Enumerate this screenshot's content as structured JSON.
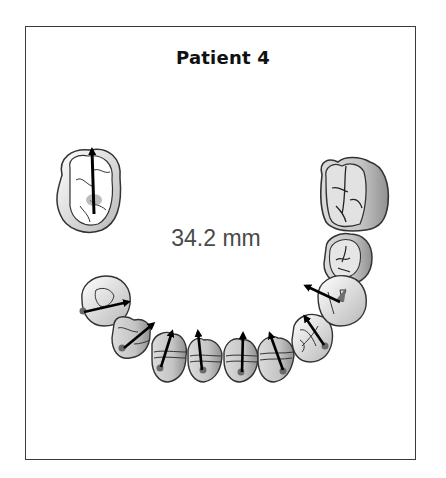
{
  "figure": {
    "title": "Patient 4",
    "measurement": "34.2 mm",
    "colors": {
      "outline": "#333333",
      "shade": "#bdbdbd",
      "arrow": "#000000",
      "dot": "#6a6a6a",
      "measurement_text": "#4a4a4a"
    },
    "teeth": [
      {
        "name": "upper-left-molar",
        "has_arrow": true,
        "arrow_direction": "up"
      },
      {
        "name": "upper-right-molar",
        "has_arrow": false
      },
      {
        "name": "upper-right-premolar",
        "has_arrow": false
      },
      {
        "name": "lower-left-premolar-2",
        "has_arrow": true
      },
      {
        "name": "lower-left-premolar-1",
        "has_arrow": true
      },
      {
        "name": "lower-left-canine",
        "has_arrow": true
      },
      {
        "name": "lower-left-incisor",
        "has_arrow": true
      },
      {
        "name": "lower-right-incisor",
        "has_arrow": true
      },
      {
        "name": "lower-right-canine",
        "has_arrow": true
      },
      {
        "name": "lower-right-premolar-1",
        "has_arrow": true
      },
      {
        "name": "lower-right-premolar-2",
        "has_arrow": true
      }
    ]
  }
}
